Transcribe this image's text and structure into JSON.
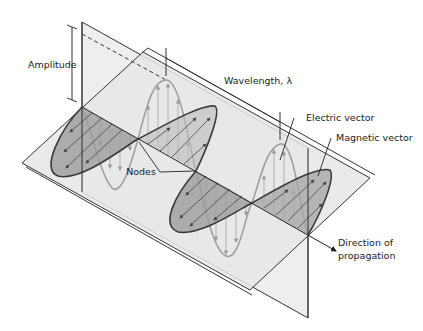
{
  "diagram": {
    "labels": {
      "amplitude": "Amplitude",
      "wavelength": "Wavelength, λ",
      "electric_vector": "Electric vector",
      "magnetic_vector": "Magnetic vector",
      "nodes": "Nodes",
      "direction_line1": "Direction of",
      "direction_line2": "propagation"
    },
    "colors": {
      "plane_fill": "#ebebeb",
      "plane_edge": "#333333",
      "electric_wave": "#a3a3a3",
      "magnetic_fill": "#9a9a9a",
      "magnetic_edge": "#3a3a3a",
      "background": "#ffffff"
    }
  }
}
